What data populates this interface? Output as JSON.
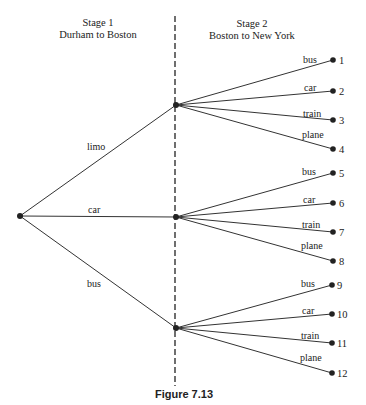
{
  "diagram": {
    "stage1": {
      "title": "Stage 1",
      "subtitle": "Durham to Boston"
    },
    "stage2": {
      "title": "Stage 2",
      "subtitle": "Boston to New York"
    },
    "stage1_edges": [
      {
        "label": "limo"
      },
      {
        "label": "car"
      },
      {
        "label": "bus"
      }
    ],
    "stage2_branches": [
      {
        "from": "limo",
        "leaves": [
          {
            "label": "bus",
            "num": "1"
          },
          {
            "label": "car",
            "num": "2"
          },
          {
            "label": "train",
            "num": "3"
          },
          {
            "label": "plane",
            "num": "4"
          }
        ]
      },
      {
        "from": "car",
        "leaves": [
          {
            "label": "bus",
            "num": "5"
          },
          {
            "label": "car",
            "num": "6"
          },
          {
            "label": "train",
            "num": "7"
          },
          {
            "label": "plane",
            "num": "8"
          }
        ]
      },
      {
        "from": "bus",
        "leaves": [
          {
            "label": "bus",
            "num": "9"
          },
          {
            "label": "car",
            "num": "10"
          },
          {
            "label": "train",
            "num": "11"
          },
          {
            "label": "plane",
            "num": "12"
          }
        ]
      }
    ],
    "caption": "Figure 7.13"
  }
}
